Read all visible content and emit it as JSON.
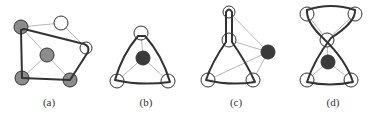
{
  "figure": {
    "colors": {
      "thick_edge": "#333333",
      "thin_edge": "#b8b8b8",
      "grey_node": "#8c8c8c",
      "dark_node": "#3a3a3a",
      "white_node": "#ffffff",
      "node_stroke": "#333333"
    },
    "panels": [
      {
        "label": "(a)",
        "label_pos": [
          49,
          106
        ],
        "nodes": [
          {
            "x": 21,
            "y": 27,
            "r": 7,
            "fill": "grey"
          },
          {
            "x": 61,
            "y": 23,
            "r": 7,
            "fill": "white"
          },
          {
            "x": 86,
            "y": 48,
            "r": 6,
            "fill": "white"
          },
          {
            "x": 47,
            "y": 55,
            "r": 7,
            "fill": "grey"
          },
          {
            "x": 22,
            "y": 78,
            "r": 7,
            "fill": "grey"
          },
          {
            "x": 70,
            "y": 80,
            "r": 7,
            "fill": "grey"
          }
        ],
        "thin_edges": [
          [
            0,
            1
          ],
          [
            1,
            2
          ],
          [
            0,
            3
          ],
          [
            3,
            4
          ],
          [
            3,
            5
          ]
        ],
        "thick_path": "M 21 30 L 22 78 L 70 80 L 88 52 Q 90 46 84 44 L 24 29 Z"
      },
      {
        "label": "(b)",
        "label_pos": [
          146,
          106
        ],
        "nodes": [
          {
            "x": 141,
            "y": 33,
            "r": 7,
            "fill": "white"
          },
          {
            "x": 143,
            "y": 58,
            "r": 7,
            "fill": "dark"
          },
          {
            "x": 117,
            "y": 81,
            "r": 7,
            "fill": "white"
          },
          {
            "x": 168,
            "y": 81,
            "r": 7,
            "fill": "white"
          }
        ],
        "thin_edges": [
          [
            1,
            0
          ],
          [
            1,
            2
          ],
          [
            1,
            3
          ]
        ],
        "thick_path": "M 138 36 Q 122 55 115 80 Q 140 86 170 82 Q 162 55 145 36 Z"
      },
      {
        "label": "(c)",
        "label_pos": [
          236,
          106
        ],
        "nodes": [
          {
            "x": 229,
            "y": 12,
            "r": 6,
            "fill": "white"
          },
          {
            "x": 229,
            "y": 40,
            "r": 7,
            "fill": "white"
          },
          {
            "x": 268,
            "y": 52,
            "r": 7,
            "fill": "dark"
          },
          {
            "x": 208,
            "y": 80,
            "r": 7,
            "fill": "white"
          },
          {
            "x": 253,
            "y": 80,
            "r": 7,
            "fill": "white"
          }
        ],
        "thin_edges": [
          [
            2,
            0
          ],
          [
            2,
            1
          ],
          [
            2,
            3
          ],
          [
            2,
            4
          ]
        ],
        "thick_path": "M 226 12 L 226 42 Q 212 62 206 80 Q 230 86 255 82 Q 246 62 232 42 L 232 12 Q 229 7 226 12 Z"
      },
      {
        "label": "(d)",
        "label_pos": [
          333,
          106
        ],
        "nodes": [
          {
            "x": 307,
            "y": 14,
            "r": 7,
            "fill": "white"
          },
          {
            "x": 355,
            "y": 14,
            "r": 7,
            "fill": "white"
          },
          {
            "x": 327,
            "y": 40,
            "r": 7,
            "fill": "white"
          },
          {
            "x": 328,
            "y": 62,
            "r": 7,
            "fill": "dark"
          },
          {
            "x": 307,
            "y": 80,
            "r": 7,
            "fill": "white"
          },
          {
            "x": 351,
            "y": 80,
            "r": 7,
            "fill": "white"
          }
        ],
        "thin_edges": [
          [
            2,
            0
          ],
          [
            2,
            1
          ],
          [
            3,
            2
          ],
          [
            3,
            4
          ],
          [
            3,
            5
          ]
        ],
        "thick_path": "M 307 10 Q 331 2 355 10 Q 356 22 331 38 Q 314 60 307 82 Q 330 87 353 82 Q 346 60 323 38 Q 306 22 307 10 Z"
      }
    ]
  }
}
